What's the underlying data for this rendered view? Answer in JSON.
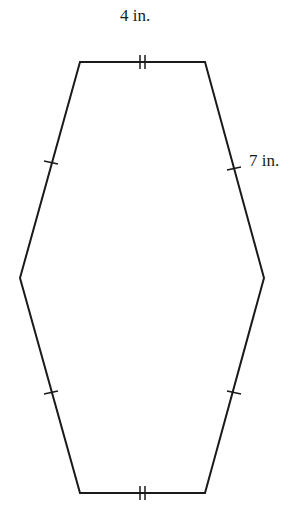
{
  "figure": {
    "shape": "hexagon",
    "labels": {
      "top_side": "4 in.",
      "right_upper_side": "7 in."
    },
    "congruence_marks": {
      "top_and_bottom_sides": "double-tick",
      "four_slanted_sides": "single-tick"
    },
    "stroke_color": "#1a1a1a",
    "background_color": "#ffffff"
  }
}
